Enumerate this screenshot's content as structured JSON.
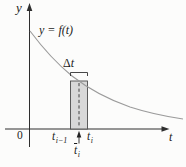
{
  "figure": {
    "type": "riemann-midpoint-rectangle-diagram",
    "curve_label": "y = f(t)",
    "y_axis_label": "y",
    "t_axis_label": "t",
    "origin_label": "0",
    "delta": {
      "symbol": "Δ",
      "variable": "t"
    },
    "left_endpoint": {
      "base": "t",
      "sub": "i−1"
    },
    "right_endpoint": {
      "base": "t",
      "sub": "i"
    },
    "sample_point": {
      "base": "t",
      "sub": "i"
    },
    "colors": {
      "background": "#fcfcfb",
      "axis": "#2e2e2e",
      "curve": "#9b9b9b",
      "rect_fill": "#d8d8d8",
      "rect_stroke": "#4d4d4d",
      "text": "#1c1c1c"
    }
  }
}
